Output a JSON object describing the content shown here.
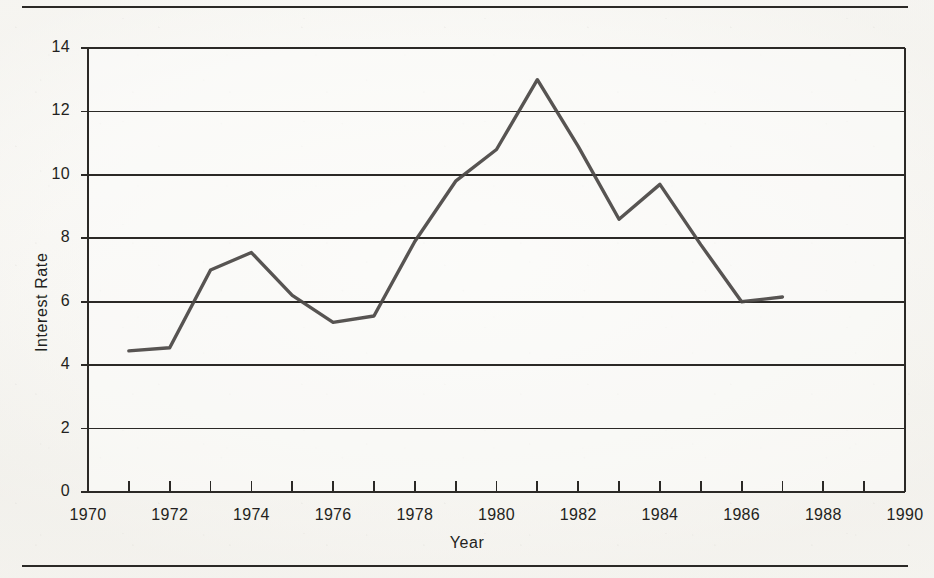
{
  "figure": {
    "background_color": "#f8f7f4",
    "ink_color": "#2b2926",
    "line_color": "#4a4745",
    "rule_top_name": "horizontal-rule-top",
    "rule_bottom_name": "horizontal-rule-bottom"
  },
  "chart_data": {
    "type": "line",
    "title": "",
    "subtitle": "",
    "xlabel": "Year",
    "ylabel": "Interest Rate",
    "xlim": [
      1970,
      1990
    ],
    "ylim": [
      0,
      14
    ],
    "x_tick_labels": [
      "1970",
      "1972",
      "1974",
      "1976",
      "1978",
      "1980",
      "1982",
      "1984",
      "1986",
      "1988",
      "1990"
    ],
    "x_tick_values": [
      1970,
      1972,
      1974,
      1976,
      1978,
      1980,
      1982,
      1984,
      1986,
      1988,
      1990
    ],
    "x_minor_tick_values": [
      1971,
      1973,
      1975,
      1977,
      1979,
      1981,
      1983,
      1985,
      1987,
      1989
    ],
    "y_tick_labels": [
      "0",
      "2",
      "4",
      "6",
      "8",
      "10",
      "12",
      "14"
    ],
    "y_tick_values": [
      0,
      2,
      4,
      6,
      8,
      10,
      12,
      14
    ],
    "grid": "horizontal-only",
    "grid_at": [
      2,
      4,
      6,
      8,
      10,
      12,
      14
    ],
    "legend": "none",
    "legend_position": "none",
    "annotations": [],
    "x": [
      1971,
      1972,
      1973,
      1974,
      1975,
      1976,
      1977,
      1978,
      1979,
      1980,
      1981,
      1982,
      1983,
      1984,
      1985,
      1986,
      1987
    ],
    "values": [
      4.45,
      4.55,
      7.0,
      7.55,
      6.2,
      5.35,
      5.55,
      7.9,
      9.8,
      10.8,
      13.0,
      10.9,
      8.6,
      9.7,
      7.8,
      6.0,
      6.15
    ],
    "series": [
      {
        "name": "Interest Rate",
        "values": [
          4.45,
          4.55,
          7.0,
          7.55,
          6.2,
          5.35,
          5.55,
          7.9,
          9.8,
          10.8,
          13.0,
          10.9,
          8.6,
          9.7,
          7.8,
          6.0,
          6.15
        ]
      }
    ]
  }
}
